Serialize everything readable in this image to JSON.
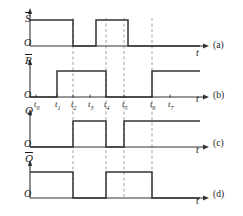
{
  "figure": {
    "stroke_color": "#333333",
    "dash_color": "#8a8a8a",
    "text_color": "#1a1a1a",
    "width": 243,
    "height": 216
  },
  "time_axis": {
    "axis_symbol": "t",
    "origin_symbol": "O",
    "ticks": [
      {
        "label": "t",
        "sub": "0",
        "x": 36
      },
      {
        "label": "t",
        "sub": "1",
        "x": 57
      },
      {
        "label": "t",
        "sub": "2",
        "x": 73
      },
      {
        "label": "t",
        "sub": "3",
        "x": 90
      },
      {
        "label": "t",
        "sub": "4",
        "x": 106
      },
      {
        "label": "t",
        "sub": "5",
        "x": 124
      },
      {
        "label": "t",
        "sub": "6",
        "x": 152
      },
      {
        "label": "t",
        "sub": "7",
        "x": 170
      }
    ],
    "dashed_guides": [
      73,
      106,
      124,
      152
    ]
  },
  "panels": [
    {
      "tag": "(a)",
      "signal": "S",
      "overbar": true,
      "origin": "O",
      "axis_symbol": "t",
      "segments": [
        {
          "from": 30,
          "to": 73,
          "level": 1
        },
        {
          "from": 73,
          "to": 96,
          "level": 0
        },
        {
          "from": 96,
          "to": 128,
          "level": 1
        },
        {
          "from": 128,
          "to": 200,
          "level": 0
        }
      ]
    },
    {
      "tag": "(b)",
      "signal": "R",
      "overbar": true,
      "origin": "O",
      "axis_symbol": "t",
      "segments": [
        {
          "from": 30,
          "to": 57,
          "level": 0
        },
        {
          "from": 57,
          "to": 106,
          "level": 1
        },
        {
          "from": 106,
          "to": 152,
          "level": 0
        },
        {
          "from": 152,
          "to": 200,
          "level": 1
        }
      ]
    },
    {
      "tag": "(c)",
      "signal": "Q",
      "overbar": false,
      "origin": "O",
      "axis_symbol": "t",
      "segments": [
        {
          "from": 30,
          "to": 73,
          "level": 0
        },
        {
          "from": 73,
          "to": 106,
          "level": 1
        },
        {
          "from": 106,
          "to": 124,
          "level": 0
        },
        {
          "from": 124,
          "to": 200,
          "level": 1
        }
      ]
    },
    {
      "tag": "(d)",
      "signal": "Q",
      "overbar": true,
      "origin": "O",
      "axis_symbol": "t",
      "segments": [
        {
          "from": 30,
          "to": 73,
          "level": 1
        },
        {
          "from": 73,
          "to": 106,
          "level": 0
        },
        {
          "from": 106,
          "to": 152,
          "level": 1
        },
        {
          "from": 152,
          "to": 200,
          "level": 0
        }
      ]
    }
  ]
}
